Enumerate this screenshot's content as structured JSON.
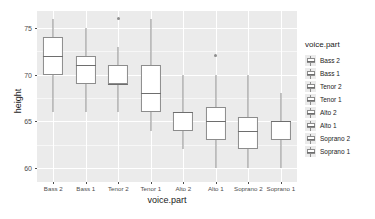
{
  "chart_data": {
    "type": "box",
    "title": "",
    "xlabel": "voice.part",
    "ylabel": "height",
    "categories": [
      "Bass 2",
      "Bass 1",
      "Tenor 2",
      "Tenor 1",
      "Alto 2",
      "Alto 1",
      "Soprano 2",
      "Soprano 1"
    ],
    "ylim": [
      58.5,
      76.8
    ],
    "yticks": [
      60,
      65,
      70,
      75
    ],
    "ytick_labels": [
      "60",
      "65",
      "70",
      "75"
    ],
    "grid": true,
    "legend_position": "right",
    "legend_title": "voice.part",
    "boxes": [
      {
        "category": "Bass 2",
        "whisker_low": 66.0,
        "q1": 70.0,
        "median": 72.0,
        "q3": 74.0,
        "whisker_high": 76.0,
        "outliers": []
      },
      {
        "category": "Bass 1",
        "whisker_low": 66.0,
        "q1": 69.0,
        "median": 71.0,
        "q3": 72.0,
        "whisker_high": 75.0,
        "outliers": []
      },
      {
        "category": "Tenor 2",
        "whisker_low": 66.0,
        "q1": 69.0,
        "median": 69.0,
        "q3": 71.0,
        "whisker_high": 73.0,
        "outliers": [
          76.0
        ]
      },
      {
        "category": "Tenor 1",
        "whisker_low": 64.0,
        "q1": 66.0,
        "median": 68.0,
        "q3": 71.0,
        "whisker_high": 76.0,
        "outliers": []
      },
      {
        "category": "Alto 2",
        "whisker_low": 62.0,
        "q1": 64.0,
        "median": 66.0,
        "q3": 66.0,
        "whisker_high": 70.0,
        "outliers": []
      },
      {
        "category": "Alto 1",
        "whisker_low": 60.0,
        "q1": 63.0,
        "median": 65.0,
        "q3": 66.5,
        "whisker_high": 70.0,
        "outliers": [
          72.0
        ]
      },
      {
        "category": "Soprano 2",
        "whisker_low": 60.0,
        "q1": 62.0,
        "median": 64.0,
        "q3": 65.5,
        "whisker_high": 70.0,
        "outliers": []
      },
      {
        "category": "Soprano 1",
        "whisker_low": 60.0,
        "q1": 63.0,
        "median": 65.0,
        "q3": 65.0,
        "whisker_high": 68.0,
        "outliers": []
      }
    ],
    "colors": {
      "panel_background": "#ebebeb",
      "major_gridline": "#ffffff",
      "minor_gridline": "#f7f7f7",
      "box_fill": "#ffffff",
      "box_stroke": "#8c8c8c",
      "median_stroke": "#6e6e6e",
      "text": "#1a1a1a",
      "tick_text": "#4d4d4d"
    }
  },
  "legend": {
    "title": "voice.part",
    "items": [
      {
        "label": "Bass 2"
      },
      {
        "label": "Bass 1"
      },
      {
        "label": "Tenor 2"
      },
      {
        "label": "Tenor 1"
      },
      {
        "label": "Alto 2"
      },
      {
        "label": "Alto 1"
      },
      {
        "label": "Soprano 2"
      },
      {
        "label": "Soprano 1"
      }
    ]
  }
}
